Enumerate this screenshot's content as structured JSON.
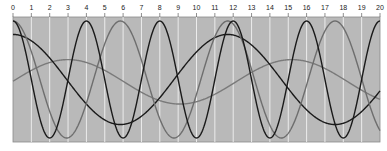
{
  "chart_data": {
    "type": "line",
    "title": "",
    "xlabel": "",
    "ylabel": "",
    "xlim": [
      0,
      20
    ],
    "ylim": [
      -1,
      1
    ],
    "x_ticks": [
      0,
      1,
      2,
      3,
      4,
      5,
      6,
      7,
      8,
      9,
      10,
      11,
      12,
      13,
      14,
      15,
      16,
      17,
      18,
      19,
      20
    ],
    "x_tick_labels": [
      "0",
      "1",
      "2",
      "3",
      "4",
      "5",
      "6",
      "7",
      "8",
      "9",
      "10",
      "11",
      "12",
      "13",
      "14",
      "15",
      "16",
      "17",
      "18",
      "19",
      "20"
    ],
    "grid": "vertical white lines at each integer",
    "legend": null,
    "background_color": "#b9b9b9",
    "series": [
      {
        "name": "fast-black",
        "color": "#1a1a1a",
        "function": "cos",
        "amplitude": 1.0,
        "period": 4.0,
        "phase": 0,
        "offset": 0,
        "x": [
          0,
          2,
          4,
          6,
          8,
          10,
          12,
          14,
          16,
          18,
          20
        ],
        "values": [
          1,
          -1,
          1,
          -1,
          1,
          -1,
          1,
          -1,
          1,
          -1,
          1
        ]
      },
      {
        "name": "medium-gray",
        "color": "#6e6e6e",
        "function": "cos",
        "amplitude": 1.0,
        "period": 5.85,
        "phase": 0,
        "offset": 0,
        "x": [
          0,
          2.93,
          5.85,
          8.78,
          11.7,
          14.63,
          17.55,
          20
        ],
        "values": [
          1,
          -1,
          1,
          -1,
          1,
          -1,
          1,
          -0.75
        ]
      },
      {
        "name": "slow-black",
        "color": "#1a1a1a",
        "function": "cos",
        "amplitude": 0.77,
        "period": 11.7,
        "phase": 0,
        "offset": 0,
        "x": [
          0,
          5.85,
          11.7,
          17.55,
          20
        ],
        "values": [
          0.77,
          -0.77,
          0.77,
          -0.77,
          -0.33
        ]
      },
      {
        "name": "slow-gray",
        "color": "#7a7a7a",
        "function": "cos",
        "amplitude": 0.38,
        "period": 12.2,
        "phase": 3.0,
        "offset": -0.04,
        "x": [
          0,
          3,
          9.1,
          15.2,
          20
        ],
        "values": [
          0.02,
          0.34,
          -0.42,
          0.34,
          -0.28
        ]
      }
    ]
  }
}
